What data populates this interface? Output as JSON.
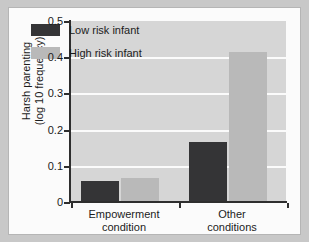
{
  "chart_data": {
    "type": "bar",
    "title": "",
    "xlabel": "",
    "ylabel": "Harsh parenting\n(log 10 frequency)",
    "ylabel_line1": "Harsh parenting",
    "ylabel_line2": "(log 10 frequency)",
    "categories": [
      "Empowerment condition",
      "Other conditions"
    ],
    "category_labels": [
      {
        "line1": "Empowerment",
        "line2": "condition"
      },
      {
        "line1": "Other",
        "line2": "conditions"
      }
    ],
    "series": [
      {
        "name": "Low risk infant",
        "values": [
          0.058,
          0.165
        ],
        "color": "#343436"
      },
      {
        "name": "High risk infant",
        "values": [
          0.066,
          0.415
        ],
        "color": "#b9b9b9"
      }
    ],
    "ylim": [
      0,
      0.5
    ],
    "ytick_values": [
      0,
      0.1,
      0.2,
      0.3,
      0.4,
      0.5
    ],
    "ytick_labels": [
      "0",
      "0.1",
      "0.2",
      "0.3",
      "0.4",
      "0.5"
    ],
    "grid": true,
    "gridlines_at": [
      0.1,
      0.2,
      0.3,
      0.4
    ],
    "legend_position": "top-left",
    "legend": [
      {
        "label": "Low risk infant",
        "color": "#343436"
      },
      {
        "label": "High risk infant",
        "color": "#b9b9b9"
      }
    ],
    "plot_background": "#d6d6d6",
    "gridline_color": "#fbfbfb",
    "axis_color": "#2e2e2e",
    "page_background": "#c8c8c8",
    "card_background": "#fbfbfb"
  }
}
